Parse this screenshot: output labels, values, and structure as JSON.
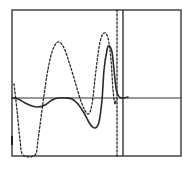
{
  "figure": {
    "colors": {
      "background": "#ffffff",
      "ink": "#2a2a2a",
      "frame": "#444444"
    },
    "frame": {
      "x0": 12,
      "y0": 10,
      "x1": 181,
      "y1": 156
    },
    "x_axis_y": 98,
    "vertical_marker_solid_x": 123,
    "vertical_marker_dashed_x": 117
  },
  "chart_data": {
    "type": "line",
    "title": "",
    "xlabel": "",
    "ylabel": "",
    "grid": false,
    "legend": null,
    "series": [
      {
        "name": "solid-waveform",
        "style": "solid",
        "points": [
          [
            12,
            98
          ],
          [
            18,
            99
          ],
          [
            25,
            103
          ],
          [
            32,
            106
          ],
          [
            38,
            107
          ],
          [
            45,
            105
          ],
          [
            52,
            100
          ],
          [
            58,
            98
          ],
          [
            66,
            98
          ],
          [
            72,
            99
          ],
          [
            78,
            104
          ],
          [
            84,
            113
          ],
          [
            90,
            124
          ],
          [
            95,
            128
          ],
          [
            99,
            122
          ],
          [
            102,
            100
          ],
          [
            104,
            70
          ],
          [
            107,
            50
          ],
          [
            109,
            46
          ],
          [
            112,
            52
          ],
          [
            114,
            70
          ],
          [
            116,
            88
          ],
          [
            118,
            95
          ],
          [
            121,
            98
          ],
          [
            123,
            98
          ],
          [
            128,
            97
          ]
        ]
      },
      {
        "name": "dashed-waveform",
        "style": "dashed",
        "points": [
          [
            14,
            84
          ],
          [
            17,
            110
          ],
          [
            20,
            140
          ],
          [
            23,
            155
          ],
          [
            35,
            155
          ],
          [
            38,
            140
          ],
          [
            42,
            110
          ],
          [
            47,
            75
          ],
          [
            52,
            52
          ],
          [
            58,
            42
          ],
          [
            64,
            48
          ],
          [
            70,
            65
          ],
          [
            76,
            85
          ],
          [
            82,
            104
          ],
          [
            88,
            114
          ],
          [
            92,
            104
          ],
          [
            96,
            70
          ],
          [
            100,
            42
          ],
          [
            104,
            33
          ],
          [
            108,
            38
          ],
          [
            111,
            60
          ],
          [
            113,
            90
          ],
          [
            115,
            104
          ],
          [
            116,
            100
          ]
        ]
      },
      {
        "name": "dashed-vertical-marker",
        "style": "dashed",
        "points": [
          [
            117,
            10
          ],
          [
            117,
            156
          ]
        ]
      }
    ]
  }
}
